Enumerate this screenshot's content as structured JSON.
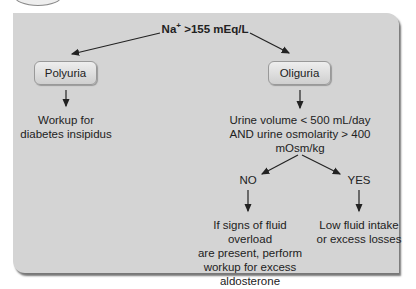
{
  "diagram": {
    "root": {
      "prefix": "Na",
      "superscript": "+",
      "text": " >155 mEq/L"
    },
    "left_branch": {
      "box_label": "Polyuria",
      "result": [
        "Workup for",
        "diabetes insipidus"
      ]
    },
    "right_branch": {
      "box_label": "Oliguria",
      "criteria": [
        "Urine volume < 500 mL/day",
        "AND urine osmolarity > 400",
        "mOsm/kg"
      ],
      "no": {
        "label": "NO",
        "result": [
          "If signs of fluid overload",
          "are present, perform",
          "workup for excess",
          "aldosterone"
        ]
      },
      "yes": {
        "label": "YES",
        "result": [
          "Low fluid intake",
          "or excess losses"
        ]
      }
    }
  }
}
